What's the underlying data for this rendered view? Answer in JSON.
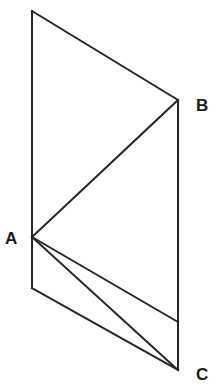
{
  "figure": {
    "background_color": "#ffffff",
    "stroke_color": "#26262a",
    "stroke_width": 2,
    "label_color": "#1b1b1f",
    "canvas": {
      "width": 217,
      "height": 387
    },
    "vertices": {
      "top_left": {
        "x": 32,
        "y": 11
      },
      "A": {
        "x": 32,
        "y": 237
      },
      "bottom_left": {
        "x": 32,
        "y": 288
      },
      "B": {
        "x": 178,
        "y": 100
      },
      "right_mid": {
        "x": 178,
        "y": 322
      },
      "C": {
        "x": 178,
        "y": 370
      }
    },
    "edges": {
      "left_vertical": "M 32 11 L 32 288",
      "top_edge": "M 32 11 L 178 100",
      "b_to_a_fold": "M 178 100 L 32 237",
      "right_vertical": "M 178 100 L 178 370",
      "a_to_right_mid": "M 32 237 L 178 322",
      "a_to_c": "M 32 237 L 178 370",
      "bottom_left_to_c": "M 32 288 L 178 370"
    },
    "labels": {
      "a": {
        "text": "A",
        "x": 5,
        "y": 240
      },
      "b": {
        "text": "B",
        "x": 196,
        "y": 107
      },
      "c": {
        "text": "C",
        "x": 196,
        "y": 376
      }
    }
  }
}
